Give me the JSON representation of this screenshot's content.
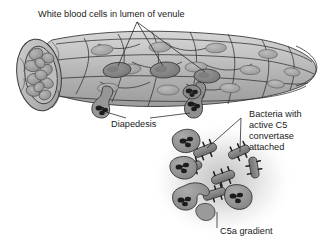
{
  "figure": {
    "type": "biology-diagram",
    "background_color": "#ffffff"
  },
  "labels": {
    "title": "White blood cells in lumen of venule",
    "diapedesis": "Diapedesis",
    "bacteria_line1": "Bacteria with",
    "bacteria_line2": "active C5",
    "bacteria_line3": "convertase",
    "bacteria_line4": "attached",
    "gradient": "C5a gradient"
  },
  "colors": {
    "text": "#1a1a1a",
    "leader_line": "#2b2b2b",
    "vessel_wall_light": "#c9c9c9",
    "vessel_wall_mid": "#b4b4b4",
    "vessel_wall_dark": "#9e9e9e",
    "cell_outline": "#3a3a3a",
    "nucleus": "#a8a8a8",
    "wbc_body": "#8f8f8f",
    "wbc_dark": "#7a7a7a",
    "lumen_cells": "#a5a5a5",
    "bacterium": "#8a8a8a",
    "bacterium_dark": "#6d6d6d",
    "neutrophil_nucleus": "#1c1c1c",
    "gradient_halo": "#bdbdbd"
  },
  "structures": {
    "venule": "longitudinal venule with cut cross-section at left end, tapering to rounded tip at right",
    "cross_section_contents": "packed erythrocytes filling the lumen",
    "endothelial_cells": "elongated flattened cells tiling the vessel wall, each with an oval nucleus",
    "wbc_in_lumen_count": 3,
    "diapedesis_cell_count": 2,
    "bacteria_count": 6,
    "neutrophils_outside_count": 5,
    "c5a_gradient": "soft radial gray halo centered on the bacterial cluster"
  }
}
